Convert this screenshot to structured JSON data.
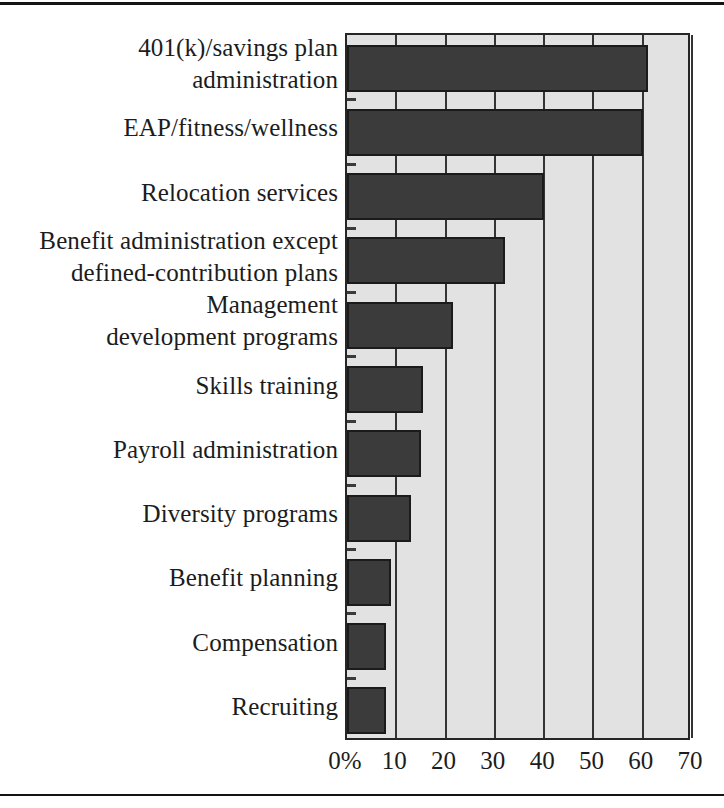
{
  "chart_data": {
    "type": "bar",
    "orientation": "horizontal",
    "title": "",
    "subtitle": "",
    "xlabel": "",
    "ylabel": "",
    "xlim": [
      0,
      70
    ],
    "xticks": [
      0,
      10,
      20,
      30,
      40,
      50,
      60,
      70
    ],
    "xtick_labels": [
      "0%",
      "10",
      "20",
      "30",
      "40",
      "50",
      "60",
      "70"
    ],
    "grid": true,
    "legend": "none",
    "categories": [
      "401(k)/savings plan\nadministration",
      "EAP/fitness/wellness",
      "Relocation services",
      "Benefit administration except\ndefined-contribution plans",
      "Management\ndevelopment programs",
      "Skills training",
      "Payroll administration",
      "Diversity programs",
      "Benefit planning",
      "Compensation",
      "Recruiting"
    ],
    "values": [
      61,
      60,
      40,
      32,
      21.5,
      15.5,
      15,
      13,
      9,
      8,
      8
    ],
    "colors": {
      "bar_fill": "#3b3b3b",
      "bar_edge": "#1b1b1b",
      "plot_background": "#e2e2e2",
      "gridline": "#343434",
      "frame": "#262626",
      "text": "#1c1c1c",
      "page_background": "#ffffff",
      "rule": "#141414"
    }
  }
}
